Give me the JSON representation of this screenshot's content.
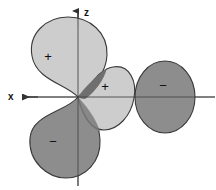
{
  "figure": {
    "background_color": "#ffffff",
    "width": 216,
    "height": 190
  },
  "axes": {
    "origin": {
      "x": 78,
      "y": 97
    },
    "x_axis": {
      "label": "x",
      "label_x": 10,
      "label_y": 96,
      "arrow_direction": "left",
      "line_start_x": 20,
      "line_end_x": 215,
      "y": 97,
      "color": "#555555"
    },
    "z_axis": {
      "label": "z",
      "label_x": 86,
      "label_y": 13,
      "arrow_direction": "up",
      "line_start_y": 10,
      "line_end_y": 186,
      "x": 78,
      "color": "#555555"
    }
  },
  "colors": {
    "positive_lobe_fill": "#c9c9c9",
    "negative_lobe_fill": "#8d8d8d",
    "overlap_fill": "#6f6f6f",
    "outline": "#3a3a3a",
    "axis": "#555555",
    "text": "#111111"
  },
  "lobes": [
    {
      "name": "upper-left-lobe",
      "sign": "+",
      "phase": "positive",
      "fill": "#c9c9c9",
      "sign_x": 48,
      "sign_y": 56
    },
    {
      "name": "middle-right-lobe",
      "sign": "+",
      "phase": "positive",
      "fill": "#c9c9c9",
      "sign_x": 105,
      "sign_y": 86
    },
    {
      "name": "lower-left-lobe",
      "sign": "−",
      "phase": "negative",
      "fill": "#8d8d8d",
      "sign_x": 53,
      "sign_y": 141
    },
    {
      "name": "far-right-lobe",
      "sign": "−",
      "phase": "negative",
      "fill": "#8d8d8d",
      "sign_x": 163,
      "sign_y": 85
    }
  ]
}
